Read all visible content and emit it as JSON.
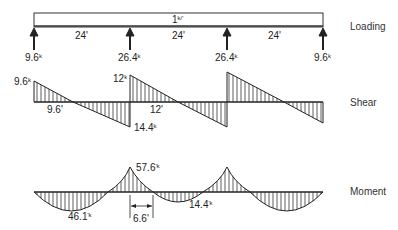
{
  "loading": {
    "title": "Loading",
    "distributed_load": {
      "value": "1",
      "unit": "k/'"
    },
    "spans": [
      "24'",
      "24'",
      "24'"
    ],
    "reactions": [
      {
        "value": "9.6",
        "unit": "k"
      },
      {
        "value": "26.4",
        "unit": "k"
      },
      {
        "value": "26.4",
        "unit": "k"
      },
      {
        "value": "9.6",
        "unit": "k"
      }
    ]
  },
  "shear": {
    "title": "Shear",
    "labels": {
      "left_end": {
        "value": "9.6",
        "unit": "k"
      },
      "zero_distance": "9.6'",
      "left_support_neg": {
        "value": "14.4",
        "unit": "k"
      },
      "mid_pos": {
        "value": "12",
        "unit": "k"
      },
      "mid_zero_distance": "12'"
    }
  },
  "moment": {
    "title": "Moment",
    "labels": {
      "span_max": {
        "value": "46.1",
        "unit": "'k"
      },
      "support_peak": {
        "value": "57.6",
        "unit": "'k"
      },
      "inflection_distance": "6.6'",
      "center_span": {
        "value": "14.4",
        "unit": "'k"
      }
    }
  },
  "colors": {
    "ink": "#222222",
    "background": "#ffffff"
  }
}
